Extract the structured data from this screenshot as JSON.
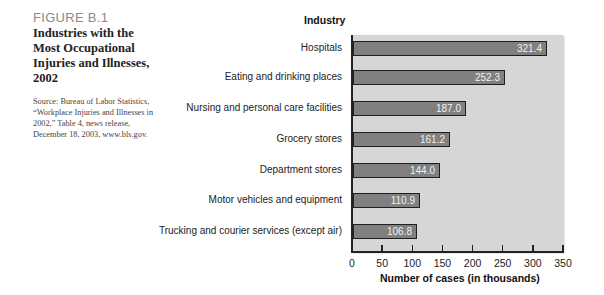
{
  "figure": {
    "number": "FIGURE B.1",
    "title": "Industries with the Most Occupational Injuries and Illnesses, 2002",
    "source": "Source: Bureau of Labor Statistics, “Workplace Injuries and Illnesses in 2002,” Table 4, news release, December 18, 2003, www.bls.gov."
  },
  "chart_data": {
    "type": "bar",
    "orientation": "horizontal",
    "title": "Industries with the Most Occupational Injuries and Illnesses, 2002",
    "ylabel": "Industry",
    "xlabel": "Number of cases (in thousands)",
    "categories": [
      "Hospitals",
      "Eating and drinking places",
      "Nursing and personal care facilities",
      "Grocery stores",
      "Department stores",
      "Motor vehicles and equipment",
      "Trucking and courier services (except air)"
    ],
    "values": [
      321.4,
      252.3,
      187.0,
      161.2,
      144.0,
      110.9,
      106.8
    ],
    "value_labels": [
      "321.4",
      "252.3",
      "187.0",
      "161.2",
      "144.0",
      "110.9",
      "106.8"
    ],
    "xlim": [
      0,
      350
    ],
    "xticks": [
      "0",
      "50",
      "100",
      "150",
      "200",
      "250",
      "300",
      "350"
    ],
    "grid": false,
    "legend": null,
    "colors": {
      "bar": "#808080",
      "bar_border": "#1f1f1f",
      "plot_bg": "#d6d6d6",
      "value_text": "#f2f2f2"
    }
  }
}
